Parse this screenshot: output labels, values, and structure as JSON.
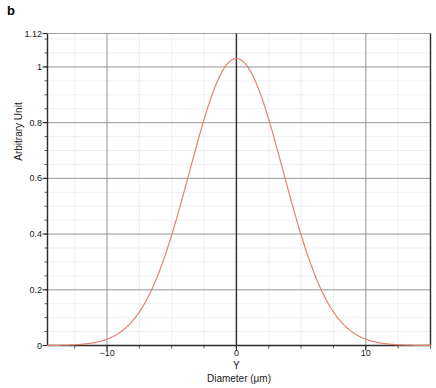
{
  "panel": {
    "label": "b"
  },
  "chart_data": {
    "type": "line",
    "title": "",
    "subtitle": "",
    "xlabel": "Diameter (μm)",
    "ylabel": "Arbitrary Unit",
    "xlim": [
      -14.6,
      15.0
    ],
    "ylim": [
      0,
      1.12
    ],
    "grid": true,
    "legend": null,
    "legend_position": "none",
    "x_tick_labels": [
      "−10",
      "0",
      "10"
    ],
    "x_tick_values": [
      -10,
      0,
      10
    ],
    "x_minor_tick_step": 2.5,
    "y_tick_labels": [
      "0",
      "0.2",
      "0.4",
      "0.6",
      "0.8",
      "1",
      "1.12"
    ],
    "y_tick_values": [
      0,
      0.2,
      0.4,
      0.6,
      0.8,
      1,
      1.12
    ],
    "y_minor_tick_step": 0.05,
    "annotations": [
      {
        "text": "Y",
        "x": 0,
        "position": "below-axis"
      }
    ],
    "series": [
      {
        "name": "Intensity profile",
        "color": "#e2836b",
        "peak_value": 1.03,
        "peak_x": 0,
        "sigma": 3.62,
        "x": [
          -14.6,
          -14.0,
          -13.5,
          -13.0,
          -12.5,
          -12.0,
          -11.5,
          -11.0,
          -10.5,
          -10.0,
          -9.5,
          -9.0,
          -8.5,
          -8.0,
          -7.5,
          -7.0,
          -6.5,
          -6.0,
          -5.5,
          -5.0,
          -4.5,
          -4.0,
          -3.5,
          -3.0,
          -2.5,
          -2.0,
          -1.5,
          -1.0,
          -0.5,
          0.0,
          0.5,
          1.0,
          1.5,
          2.0,
          2.5,
          3.0,
          3.5,
          4.0,
          4.5,
          5.0,
          5.5,
          6.0,
          6.5,
          7.0,
          7.5,
          8.0,
          8.5,
          9.0,
          9.5,
          10.0,
          10.5,
          11.0,
          11.5,
          12.0,
          12.5,
          13.0,
          13.5,
          14.0,
          14.5,
          15.0
        ],
        "y": [
          0.006,
          0.009,
          0.012,
          0.015,
          0.02,
          0.026,
          0.033,
          0.042,
          0.053,
          0.066,
          0.082,
          0.101,
          0.123,
          0.149,
          0.179,
          0.213,
          0.252,
          0.295,
          0.343,
          0.395,
          0.45,
          0.508,
          0.568,
          0.628,
          0.687,
          0.743,
          0.795,
          0.871,
          0.935,
          1.03,
          0.987,
          0.912,
          0.842,
          0.781,
          0.715,
          0.649,
          0.585,
          0.523,
          0.464,
          0.409,
          0.357,
          0.309,
          0.265,
          0.226,
          0.191,
          0.16,
          0.133,
          0.11,
          0.09,
          0.073,
          0.059,
          0.047,
          0.038,
          0.03,
          0.024,
          0.019,
          0.015,
          0.012,
          0.009,
          0.007
        ]
      }
    ]
  },
  "style": {
    "curve_color": "#e2836b",
    "major_grid_color": "#808080",
    "minor_grid_color": "#e8e8ee",
    "axis_color": "#2b2b2b",
    "text_color": "#1a1a1a",
    "background": "#ffffff"
  }
}
